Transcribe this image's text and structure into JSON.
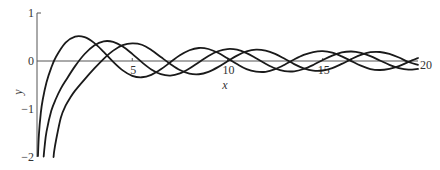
{
  "chart_data": {
    "type": "line",
    "title": "",
    "xlabel": "x",
    "ylabel": "y",
    "xlim": [
      0,
      20
    ],
    "ylim": [
      -2,
      1
    ],
    "grid": false,
    "legend": null,
    "x_ticks": [
      5,
      10,
      15,
      20
    ],
    "x_tick_labels": [
      "5",
      "10",
      "15",
      "20"
    ],
    "y_ticks": [
      1,
      0,
      -1,
      -2
    ],
    "y_tick_labels": [
      "1",
      "0",
      "−1",
      "−2"
    ],
    "series": [
      {
        "name": "Y0",
        "x": [
          0.05,
          0.1,
          0.2,
          0.3,
          0.5,
          0.75,
          1,
          1.5,
          2,
          2.5,
          3,
          3.5,
          4,
          4.5,
          5,
          5.5,
          6,
          6.5,
          7,
          7.5,
          8,
          8.5,
          9,
          9.5,
          10,
          10.5,
          11,
          11.5,
          12,
          12.5,
          13,
          13.5,
          14,
          14.5,
          15,
          15.5,
          16,
          16.5,
          17,
          17.5,
          18,
          18.5,
          19,
          19.5,
          20
        ],
        "y": [
          -1.98,
          -1.534,
          -1.081,
          -0.807,
          -0.444,
          -0.138,
          0.088,
          0.382,
          0.51,
          0.498,
          0.377,
          0.189,
          -0.017,
          -0.195,
          -0.309,
          -0.339,
          -0.288,
          -0.173,
          -0.026,
          0.118,
          0.224,
          0.271,
          0.25,
          0.171,
          0.056,
          -0.064,
          -0.169,
          -0.22,
          -0.225,
          -0.171,
          -0.078,
          0.032,
          0.127,
          0.187,
          0.205,
          0.174,
          0.096,
          -0.002,
          -0.098,
          -0.167,
          -0.187,
          -0.162,
          -0.106,
          -0.019,
          0.063
        ]
      },
      {
        "name": "Y1",
        "x": [
          0.35,
          0.4,
          0.5,
          0.75,
          1,
          1.25,
          1.5,
          2,
          2.5,
          3,
          3.5,
          4,
          4.5,
          5,
          5.5,
          6,
          6.5,
          7,
          7.5,
          8,
          8.5,
          9,
          9.5,
          10,
          10.5,
          11,
          11.5,
          12,
          12.5,
          13,
          13.5,
          14,
          14.5,
          15,
          15.5,
          16,
          16.5,
          17,
          17.5,
          18,
          18.5,
          19,
          19.5,
          20
        ],
        "y": [
          -1.99,
          -1.781,
          -1.471,
          -1.038,
          -0.781,
          -0.576,
          -0.412,
          -0.107,
          0.146,
          0.325,
          0.41,
          0.398,
          0.301,
          0.148,
          -0.024,
          -0.175,
          -0.274,
          -0.303,
          -0.259,
          -0.158,
          -0.026,
          0.104,
          0.203,
          0.249,
          0.235,
          0.164,
          0.058,
          -0.057,
          -0.154,
          -0.21,
          -0.215,
          -0.167,
          -0.082,
          0.021,
          0.113,
          0.178,
          0.198,
          0.17,
          0.103,
          0.011,
          -0.079,
          -0.148,
          -0.181,
          -0.166
        ]
      },
      {
        "name": "Y2",
        "x": [
          0.87,
          0.9,
          1,
          1.25,
          1.5,
          1.75,
          2,
          2.5,
          3,
          3.5,
          4,
          4.5,
          5,
          5.5,
          6,
          6.5,
          7,
          7.5,
          8,
          8.5,
          9,
          9.5,
          10,
          10.5,
          11,
          11.5,
          12,
          12.5,
          13,
          13.5,
          14,
          14.5,
          15,
          15.5,
          16,
          16.5,
          17,
          17.5,
          18,
          18.5,
          19,
          19.5,
          20
        ],
        "y": [
          -2.0,
          -1.884,
          -1.651,
          -1.18,
          -0.932,
          -0.76,
          -0.617,
          -0.381,
          -0.16,
          0.045,
          0.216,
          0.329,
          0.368,
          0.339,
          0.23,
          0.083,
          -0.061,
          -0.187,
          -0.263,
          -0.276,
          -0.226,
          -0.128,
          -0.006,
          0.113,
          0.199,
          0.237,
          0.216,
          0.147,
          0.046,
          -0.064,
          -0.152,
          -0.201,
          -0.198,
          -0.148,
          -0.061,
          0.039,
          0.128,
          0.183,
          0.188,
          0.148,
          0.073,
          -0.021,
          -0.08
        ]
      }
    ]
  },
  "layout": {
    "origin_px": [
      37,
      61
    ],
    "px_per_x": 19.05,
    "px_per_y": 48
  }
}
